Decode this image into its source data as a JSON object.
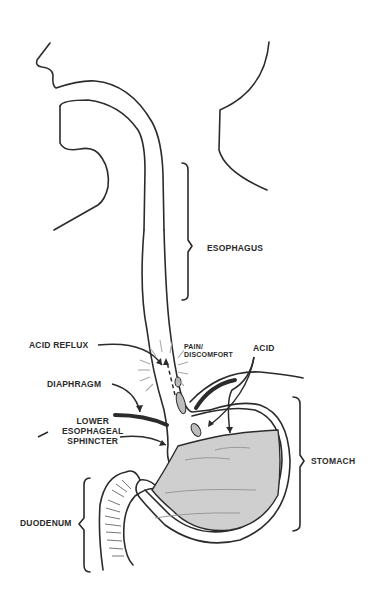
{
  "diagram": {
    "stroke_color": "#2b2b2b",
    "fill_gray": "#cfcfcf",
    "wave_color": "#9a9a9a",
    "labels": {
      "esophagus": "ESOPHAGUS",
      "acid_reflux": "ACID REFLUX",
      "pain_line1": "PAIN/",
      "pain_line2": "DISCOMFORT",
      "acid": "ACID",
      "diaphragm": "DIAPHRAGM",
      "les_line1": "LOWER",
      "les_line2": "ESOPHAGEAL",
      "les_line3": "SPHINCTER",
      "stomach": "STOMACH",
      "duodenum": "DUODENUM"
    }
  }
}
